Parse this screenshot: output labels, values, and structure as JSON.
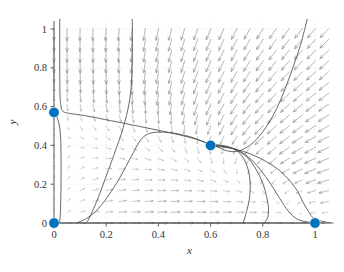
{
  "chart_data": {
    "type": "scatter",
    "title": "",
    "subtitle": "",
    "xlabel": "x",
    "ylabel": "y",
    "xlim": [
      -0.04,
      1.08
    ],
    "ylim": [
      -0.05,
      1.05
    ],
    "xticks": [
      0,
      0.2,
      0.4,
      0.6,
      0.8,
      1
    ],
    "xticklabels": [
      "0",
      "0.2",
      "0.4",
      "0.6",
      "0.8",
      "1"
    ],
    "yticks": [
      0,
      0.2,
      0.4,
      0.6,
      0.8,
      1
    ],
    "yticklabels": [
      "0",
      "0.2",
      "0.4",
      "0.6",
      "0.8",
      "1"
    ],
    "grid": true,
    "legend": "none",
    "accent_color": "#0072BD",
    "arrow_color": "#808080",
    "curve_color": "#4d4d4d",
    "axis_color": "#4d4d4d",
    "grid_color": "#d8d8d8",
    "equilibria": [
      {
        "name": "equilibrium-origin",
        "x": 0.0,
        "y": 0.0
      },
      {
        "name": "equilibrium-y-axis",
        "x": 0.0,
        "y": 0.57
      },
      {
        "name": "equilibrium-saddle",
        "x": 0.6,
        "y": 0.4
      },
      {
        "name": "equilibrium-x-axis",
        "x": 1.0,
        "y": 0.0
      }
    ],
    "quiver": {
      "x_start": 0.0,
      "x_step": 0.05,
      "x_count": 22,
      "y_start": 0.0,
      "y_step": 0.0555,
      "y_count": 19,
      "description": "downward arrows above the y=0.45 nullcline, upward/rightward arrows below"
    },
    "trajectories": [
      {
        "name": "separatrix-upper-left",
        "points": [
          [
            0.022,
            1.05
          ],
          [
            0.022,
            0.8
          ],
          [
            0.023,
            0.66
          ],
          [
            0.027,
            0.6
          ],
          [
            0.035,
            0.575
          ],
          [
            0.06,
            0.565
          ],
          [
            0.12,
            0.553
          ],
          [
            0.22,
            0.527
          ],
          [
            0.32,
            0.5
          ],
          [
            0.42,
            0.472
          ],
          [
            0.5,
            0.448
          ],
          [
            0.56,
            0.425
          ],
          [
            0.6,
            0.402
          ]
        ]
      },
      {
        "name": "separatrix-left-descending",
        "points": [
          [
            0.0,
            0.57
          ],
          [
            0.012,
            0.545
          ],
          [
            0.022,
            0.49
          ],
          [
            0.026,
            0.42
          ],
          [
            0.027,
            0.33
          ],
          [
            0.027,
            0.22
          ],
          [
            0.026,
            0.12
          ],
          [
            0.024,
            0.04
          ],
          [
            0.021,
            0.0
          ]
        ]
      },
      {
        "name": "separatrix-right-incoming",
        "points": [
          [
            0.6,
            0.402
          ],
          [
            0.655,
            0.395
          ],
          [
            0.7,
            0.378
          ],
          [
            0.74,
            0.345
          ],
          [
            0.775,
            0.3
          ],
          [
            0.81,
            0.24
          ],
          [
            0.845,
            0.17
          ],
          [
            0.875,
            0.105
          ],
          [
            0.905,
            0.05
          ],
          [
            0.94,
            0.015
          ],
          [
            1.0,
            0.0
          ]
        ]
      },
      {
        "name": "trajectory-rising-left",
        "points": [
          [
            0.085,
            0.0
          ],
          [
            0.12,
            0.02
          ],
          [
            0.16,
            0.06
          ],
          [
            0.2,
            0.125
          ],
          [
            0.24,
            0.205
          ],
          [
            0.275,
            0.29
          ],
          [
            0.305,
            0.365
          ],
          [
            0.33,
            0.425
          ],
          [
            0.355,
            0.455
          ],
          [
            0.39,
            0.468
          ],
          [
            0.45,
            0.465
          ],
          [
            0.52,
            0.445
          ],
          [
            0.575,
            0.418
          ],
          [
            0.6,
            0.402
          ]
        ]
      },
      {
        "name": "trajectory-loop-mid",
        "points": [
          [
            0.3,
            1.05
          ],
          [
            0.3,
            0.88
          ],
          [
            0.298,
            0.75
          ],
          [
            0.292,
            0.655
          ],
          [
            0.283,
            0.585
          ],
          [
            0.272,
            0.525
          ],
          [
            0.258,
            0.46
          ],
          [
            0.24,
            0.39
          ],
          [
            0.22,
            0.315
          ],
          [
            0.198,
            0.235
          ],
          [
            0.175,
            0.15
          ],
          [
            0.152,
            0.075
          ],
          [
            0.133,
            0.02
          ],
          [
            0.122,
            0.0
          ]
        ]
      },
      {
        "name": "trajectory-right-arc",
        "points": [
          [
            0.97,
            1.05
          ],
          [
            0.945,
            0.92
          ],
          [
            0.915,
            0.8
          ],
          [
            0.885,
            0.69
          ],
          [
            0.855,
            0.595
          ],
          [
            0.82,
            0.51
          ],
          [
            0.785,
            0.445
          ],
          [
            0.75,
            0.4
          ],
          [
            0.715,
            0.375
          ],
          [
            0.685,
            0.368
          ],
          [
            0.655,
            0.375
          ],
          [
            0.63,
            0.39
          ],
          [
            0.6,
            0.402
          ]
        ]
      },
      {
        "name": "trajectory-outer-descending",
        "points": [
          [
            0.605,
            0.4
          ],
          [
            0.66,
            0.392
          ],
          [
            0.705,
            0.372
          ],
          [
            0.745,
            0.332
          ],
          [
            0.775,
            0.275
          ],
          [
            0.8,
            0.205
          ],
          [
            0.815,
            0.135
          ],
          [
            0.822,
            0.07
          ],
          [
            0.818,
            0.025
          ],
          [
            0.805,
            0.0
          ]
        ]
      },
      {
        "name": "trajectory-far-right-tail",
        "points": [
          [
            0.62,
            0.395
          ],
          [
            0.69,
            0.382
          ],
          [
            0.755,
            0.355
          ],
          [
            0.815,
            0.315
          ],
          [
            0.865,
            0.27
          ],
          [
            0.905,
            0.215
          ],
          [
            0.935,
            0.16
          ],
          [
            0.955,
            0.105
          ],
          [
            0.975,
            0.06
          ],
          [
            1.0,
            0.02
          ],
          [
            1.06,
            0.0
          ]
        ]
      },
      {
        "name": "trajectory-inner-loop",
        "points": [
          [
            0.6,
            0.405
          ],
          [
            0.645,
            0.4
          ],
          [
            0.685,
            0.385
          ],
          [
            0.715,
            0.355
          ],
          [
            0.735,
            0.31
          ],
          [
            0.748,
            0.25
          ],
          [
            0.752,
            0.185
          ],
          [
            0.748,
            0.12
          ],
          [
            0.738,
            0.06
          ],
          [
            0.725,
            0.0
          ]
        ]
      },
      {
        "name": "trajectory-x-axis-line",
        "points": [
          [
            0.0,
            0.0
          ],
          [
            0.25,
            0.0
          ],
          [
            0.5,
            0.0
          ],
          [
            0.75,
            0.0
          ],
          [
            1.0,
            0.0
          ],
          [
            1.07,
            0.0
          ]
        ]
      }
    ]
  }
}
